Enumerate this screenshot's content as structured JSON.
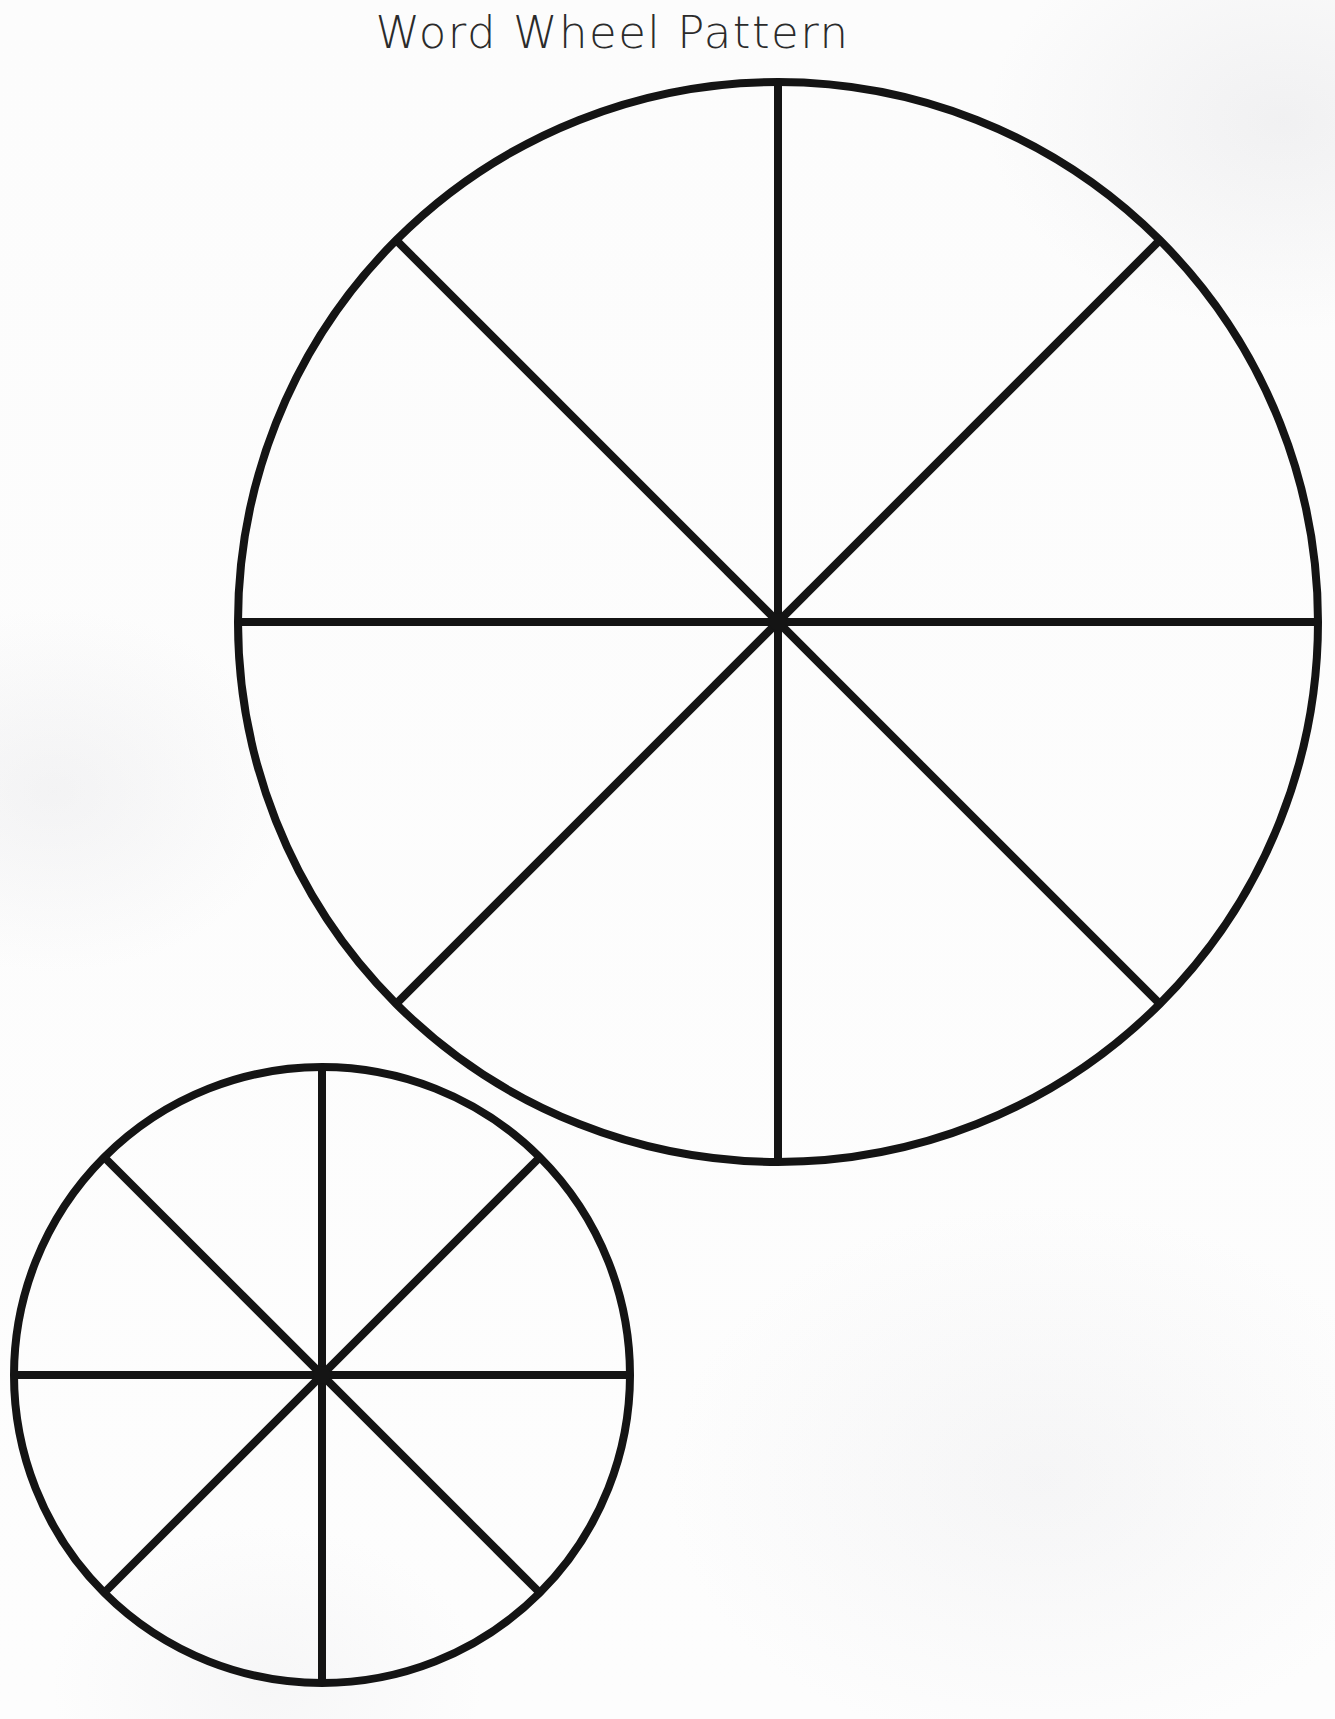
{
  "page": {
    "title": "Word Wheel Pattern",
    "background_color": "#fdfdfd",
    "ink_color": "#141414",
    "width": 1335,
    "height": 1719,
    "document_type": "printable worksheet template"
  },
  "chart_data": {
    "type": "pie",
    "title": "Word Wheel Pattern",
    "xlabel": "",
    "ylabel": "",
    "grid": false,
    "legend": null,
    "categories": [
      "1",
      "2",
      "3",
      "4",
      "5",
      "6",
      "7",
      "8"
    ],
    "values": [
      12.5,
      12.5,
      12.5,
      12.5,
      12.5,
      12.5,
      12.5,
      12.5
    ],
    "slice_labels": [],
    "wheels": [
      {
        "name": "large-word-wheel",
        "center_x": 778,
        "center_y": 622,
        "radius": 540,
        "sectors": 8,
        "sector_angle_degrees": 45,
        "spoke_angles_degrees": [
          0,
          45,
          90,
          135
        ],
        "stroke_width": 8,
        "filled": false
      },
      {
        "name": "small-word-wheel",
        "center_x": 322,
        "center_y": 1375,
        "radius": 308,
        "sectors": 8,
        "sector_angle_degrees": 45,
        "spoke_angles_degrees": [
          0,
          45,
          90,
          135
        ],
        "stroke_width": 8,
        "filled": false
      }
    ]
  }
}
